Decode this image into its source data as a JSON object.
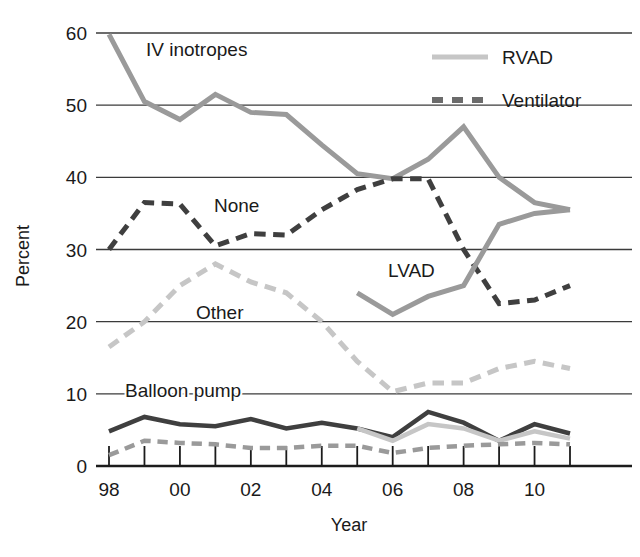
{
  "chart_data": {
    "type": "line",
    "title": "",
    "subtitle": "",
    "xlabel": "Year",
    "ylabel": "Percent",
    "x": [
      1998,
      1999,
      2000,
      2001,
      2002,
      2003,
      2004,
      2005,
      2006,
      2007,
      2008,
      2009,
      2010,
      2011
    ],
    "xtick_labels": [
      "98",
      "",
      "00",
      "",
      "02",
      "",
      "04",
      "",
      "06",
      "",
      "08",
      "",
      "10",
      ""
    ],
    "xtick_labels_shown": [
      "98",
      "00",
      "02",
      "04",
      "06",
      "08",
      "10"
    ],
    "xlim": [
      1998,
      2011
    ],
    "ylim": [
      0,
      60
    ],
    "ytick_labels": [
      "0",
      "10",
      "20",
      "30",
      "40",
      "50",
      "60"
    ],
    "yticks": [
      0,
      10,
      20,
      30,
      40,
      50,
      60
    ],
    "grid": "horizontal",
    "legend_position": "top-right",
    "series": [
      {
        "name": "IV inotropes",
        "label_kind": "annotation",
        "style": "solid",
        "color": "#9a9a9a",
        "width": 5,
        "values": [
          59.8,
          50.5,
          48.0,
          51.5,
          49.0,
          48.7,
          44.5,
          40.5,
          39.8,
          42.5,
          47.0,
          40.0,
          36.5,
          35.5
        ]
      },
      {
        "name": "None",
        "label_kind": "annotation",
        "style": "dashed",
        "color": "#3f3f3f",
        "width": 5,
        "values": [
          30.0,
          36.5,
          36.3,
          30.5,
          32.2,
          32.0,
          35.5,
          38.3,
          39.8,
          39.8,
          30.0,
          22.5,
          23.0,
          25.0
        ]
      },
      {
        "name": "Other",
        "label_kind": "annotation",
        "style": "dashed",
        "color": "#c6c6c6",
        "width": 5,
        "values": [
          16.5,
          20.0,
          25.0,
          28.0,
          25.5,
          24.0,
          20.0,
          14.5,
          10.3,
          11.5,
          11.5,
          13.5,
          14.5,
          13.5
        ]
      },
      {
        "name": "Balloon pump",
        "label_kind": "annotation",
        "style": "solid",
        "color": "#3f3f3f",
        "width": 4.5,
        "values": [
          4.8,
          6.8,
          5.8,
          5.5,
          6.5,
          5.2,
          6.0,
          5.2,
          4.0,
          7.5,
          6.0,
          3.5,
          5.8,
          4.5
        ]
      },
      {
        "name": "LVAD",
        "label_kind": "annotation",
        "style": "solid",
        "color": "#9a9a9a",
        "width": 5,
        "values": [
          null,
          null,
          null,
          null,
          null,
          null,
          null,
          24.0,
          21.0,
          23.5,
          25.0,
          33.5,
          35.0,
          35.5
        ]
      },
      {
        "name": "RVAD",
        "label_kind": "legend",
        "style": "solid",
        "color": "#c6c6c6",
        "width": 4.5,
        "values": [
          null,
          null,
          null,
          null,
          null,
          null,
          null,
          5.2,
          3.5,
          5.8,
          5.2,
          3.5,
          4.8,
          3.8
        ]
      },
      {
        "name": "Ventilator",
        "label_kind": "legend",
        "style": "dashed",
        "color": "#9a9a9a",
        "width": 4.5,
        "values": [
          1.5,
          3.5,
          3.2,
          3.0,
          2.5,
          2.5,
          2.8,
          2.8,
          1.8,
          2.5,
          2.8,
          3.0,
          3.2,
          3.0
        ]
      }
    ],
    "annotations": [
      {
        "text": "IV inotropes",
        "x_px": 146,
        "y_px": 56
      },
      {
        "text": "None",
        "x_px": 214,
        "y_px": 212
      },
      {
        "text": "Other",
        "x_px": 196,
        "y_px": 319
      },
      {
        "text": "Balloon pump",
        "x_px": 125,
        "y_px": 397
      },
      {
        "text": "LVAD",
        "x_px": 388,
        "y_px": 277
      }
    ],
    "legend": [
      {
        "label": "RVAD",
        "color": "#c6c6c6",
        "style": "solid"
      },
      {
        "label": "Ventilator",
        "color": "#6b6b6b",
        "style": "dashed"
      }
    ]
  },
  "axes": {
    "ylabel": "Percent",
    "xlabel": "Year"
  }
}
